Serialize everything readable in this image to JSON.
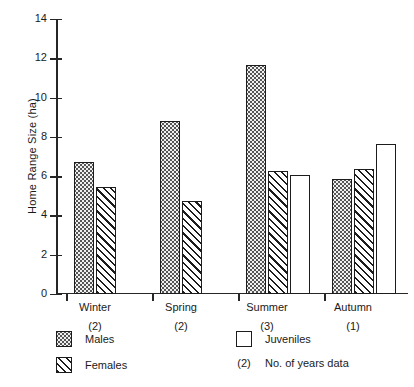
{
  "chart_data": {
    "type": "bar",
    "title": "",
    "xlabel": "",
    "ylabel": "Home Range Size (ha)",
    "ylim": [
      0,
      14
    ],
    "ytick_step": 2,
    "yticks": [
      "14",
      "12",
      "10",
      "8",
      "6",
      "4",
      "2",
      "0"
    ],
    "grid": false,
    "legend_position": "below-left",
    "categories": [
      "Winter",
      "Spring",
      "Summer",
      "Autumn"
    ],
    "category_years": [
      "(2)",
      "(2)",
      "(3)",
      "(1)"
    ],
    "series": [
      {
        "name": "Males",
        "values": [
          6.7,
          8.8,
          11.65,
          5.85
        ]
      },
      {
        "name": "Females",
        "values": [
          5.45,
          4.75,
          6.25,
          6.35
        ]
      },
      {
        "name": "Juveniles",
        "values": [
          null,
          null,
          6.05,
          7.65
        ]
      }
    ],
    "legend_entries": [
      {
        "label": "Males",
        "swatch": "dotted"
      },
      {
        "label": "Females",
        "swatch": "hatched"
      },
      {
        "label": "Juveniles",
        "swatch": "open"
      },
      {
        "label": "No. of years data",
        "swatch": "paren",
        "paren": "(2)"
      }
    ]
  }
}
